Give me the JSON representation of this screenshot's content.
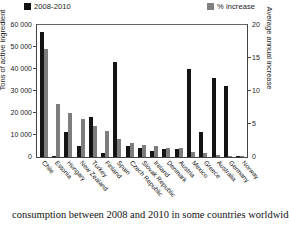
{
  "legend": {
    "items": [
      {
        "label": "2008-2010",
        "color": "#141414",
        "name": "legend-series-tons"
      },
      {
        "label": "% increase",
        "color": "#7d7d7d",
        "name": "legend-series-pct"
      }
    ]
  },
  "axes": {
    "left_title": "Tons of active ingredient",
    "right_title": "Average annual increase",
    "left_ticks": [
      "60 000",
      "50 000",
      "40 000",
      "30 000",
      "20 000",
      "10 000",
      "0"
    ],
    "right_ticks": [
      "20",
      "15",
      "10",
      "5",
      "0"
    ]
  },
  "caption": {
    "text": "consumption between 2008 and 2010 in some countries worldwide,"
  },
  "chart_data": {
    "type": "bar",
    "title": "",
    "xlabel": "",
    "ylabel": "Tons of active ingredient",
    "y2label": "Average annual increase",
    "ylim": [
      0,
      60000
    ],
    "y2lim": [
      0,
      20
    ],
    "grid": false,
    "legend_position": "top",
    "categories": [
      "Chile",
      "Estonia",
      "Hungary",
      "New Zealand",
      "Turkey",
      "Finland",
      "Spain",
      "Czech Republic",
      "Slovak Republic",
      "Ireland",
      "Denmark",
      "Austria",
      "Mexico",
      "Greece",
      "Australia",
      "Germany",
      "Norway"
    ],
    "series": [
      {
        "name": "2008-2010",
        "axis": "left",
        "color": "#141414",
        "values": [
          57000,
          200,
          11300,
          5200,
          18000,
          1700,
          43000,
          5200,
          4000,
          2600,
          3800,
          3800,
          40000,
          11400,
          35700,
          32300,
          300
        ]
      },
      {
        "name": "% increase",
        "axis": "right",
        "color": "#7d7d7d",
        "values": [
          16.3,
          8.0,
          6.7,
          5.7,
          4.7,
          3.9,
          2.8,
          2.1,
          1.8,
          1.7,
          1.3,
          1.3,
          0.75,
          0.65,
          0.3,
          0.2,
          0.1
        ]
      }
    ]
  }
}
